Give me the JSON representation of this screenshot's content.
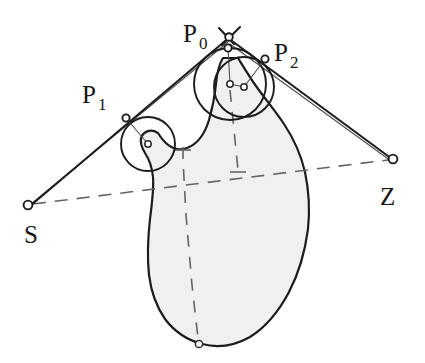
{
  "figure": {
    "background_color": "#ffffff",
    "blob_fill_color": "#f0f0f0",
    "stroke_color": "#1c1c1c",
    "dash_color": "#646464",
    "width": 425,
    "height": 363
  },
  "labels": {
    "s": {
      "text": "S",
      "sub": "",
      "x": 24,
      "y": 243
    },
    "z": {
      "text": "Z",
      "sub": "",
      "x": 380,
      "y": 205
    },
    "p0": {
      "text": "P",
      "sub": "0",
      "x": 183,
      "y": 42
    },
    "p1": {
      "text": "P",
      "sub": "1",
      "x": 82,
      "y": 103
    },
    "p2": {
      "text": "P",
      "sub": "2",
      "x": 274,
      "y": 61
    }
  },
  "points": {
    "s": {
      "name": "S",
      "x": 28,
      "y": 205
    },
    "z": {
      "name": "Z",
      "x": 393,
      "y": 159
    },
    "apex": {
      "name": "apex",
      "x": 229,
      "y": 38
    },
    "p0": {
      "name": "P0",
      "x": 228,
      "y": 48
    },
    "p1": {
      "name": "P1",
      "x": 126,
      "y": 118
    },
    "p2": {
      "name": "P2",
      "x": 265,
      "y": 59
    },
    "c1_center": {
      "name": "circle-1-center",
      "x": 148,
      "y": 144
    },
    "c0_center": {
      "name": "circle-0-center",
      "x": 230,
      "y": 84
    },
    "c2_center": {
      "name": "circle-2-center",
      "x": 244,
      "y": 87
    },
    "blob_bottom": {
      "name": "blob-bottom-node",
      "x": 199,
      "y": 344
    }
  },
  "circles": {
    "c1": {
      "name": "tangent-circle-p1",
      "cx": 148,
      "cy": 144,
      "r": 27
    },
    "c0": {
      "name": "tangent-circle-p0",
      "cx": 230,
      "cy": 84,
      "r": 36
    },
    "c2": {
      "name": "tangent-circle-p2",
      "cx": 244,
      "cy": 87,
      "r": 30
    }
  },
  "dashed_lines": {
    "baseline": {
      "name": "baseline-s-to-z",
      "from": "S",
      "to": "Z"
    },
    "vertical_left": {
      "name": "vertical-dashed-left",
      "from": "notch",
      "to": "blob-bottom"
    },
    "vertical_right": {
      "name": "vertical-dashed-right",
      "from": "circle-0-center",
      "to": "baseline"
    }
  },
  "segments": {
    "s_apex": {
      "name": "segment-s-to-apex",
      "from": "S",
      "to": "apex"
    },
    "apex_z": {
      "name": "segment-apex-to-z",
      "from": "apex",
      "to": "Z"
    }
  }
}
